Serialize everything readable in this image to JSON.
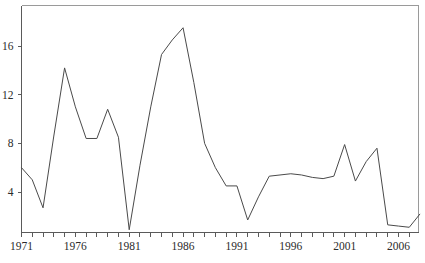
{
  "chart_data": {
    "type": "line",
    "title": "",
    "subtitle": "",
    "xlabel": "",
    "ylabel": "",
    "xlim": [
      1971,
      2008
    ],
    "ylim": [
      0.2,
      18.6
    ],
    "grid": false,
    "legend": null,
    "legend_position": "none",
    "line_color": "#4a4a4a",
    "frame_color": "#9a9a9a",
    "axis_color": "#5a5a5a",
    "background_color": "#ffffff",
    "x_tick_labels": [
      "1971",
      "1976",
      "1981",
      "1986",
      "1991",
      "1996",
      "2001",
      "2006"
    ],
    "x_tick_label_values": [
      1971,
      1976,
      1981,
      1986,
      1991,
      1996,
      2001,
      2006
    ],
    "x_minor_ticks_every": 1,
    "y_tick_labels": [
      "4",
      "8",
      "12",
      "16"
    ],
    "y_tick_label_values": [
      4,
      8,
      12,
      16
    ],
    "x": [
      1971,
      1972,
      1973,
      1974,
      1975,
      1976,
      1977,
      1978,
      1979,
      1980,
      1981,
      1982,
      1983,
      1984,
      1985,
      1986,
      1987,
      1988,
      1989,
      1990,
      1991,
      1992,
      1993,
      1994,
      1995,
      1996,
      1997,
      1998,
      1999,
      2000,
      2001,
      2002,
      2003,
      2004,
      2005,
      2006,
      2007,
      2008
    ],
    "values": [
      6.0,
      5.0,
      2.7,
      8.6,
      14.2,
      11.0,
      8.4,
      8.4,
      10.8,
      8.5,
      0.9,
      6.2,
      11.0,
      15.3,
      16.5,
      17.5,
      13.0,
      8.0,
      6.0,
      4.5,
      4.5,
      1.7,
      3.6,
      5.3,
      5.4,
      5.5,
      5.4,
      5.2,
      5.1,
      5.3,
      7.9,
      4.9,
      6.5,
      7.6,
      1.3,
      1.2,
      1.1,
      2.2
    ],
    "series": [
      {
        "name": "series-1",
        "values": [
          6.0,
          5.0,
          2.7,
          8.6,
          14.2,
          11.0,
          8.4,
          8.4,
          10.8,
          8.5,
          0.9,
          6.2,
          11.0,
          15.3,
          16.5,
          17.5,
          13.0,
          8.0,
          6.0,
          4.5,
          4.5,
          1.7,
          3.6,
          5.3,
          5.4,
          5.5,
          5.4,
          5.2,
          5.1,
          5.3,
          7.9,
          4.9,
          6.5,
          7.6,
          1.3,
          1.2,
          1.1,
          2.2
        ]
      }
    ],
    "annotations": []
  }
}
